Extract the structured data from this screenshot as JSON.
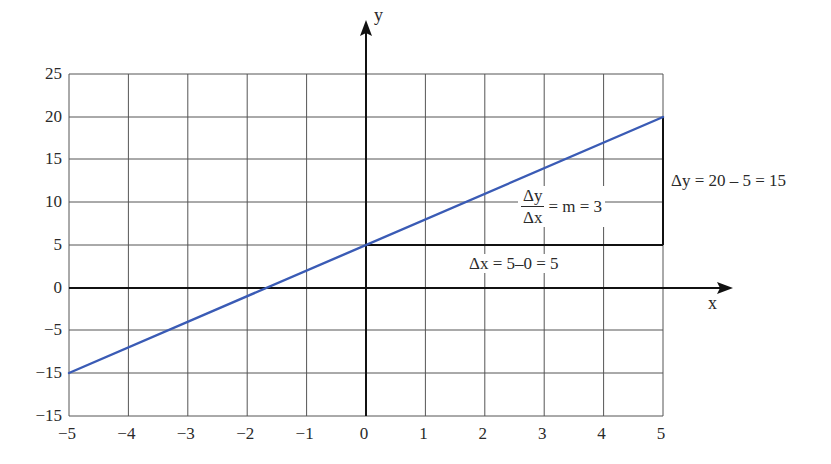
{
  "chart_data": {
    "type": "line",
    "title": "",
    "xlabel": "x",
    "ylabel": "y",
    "xlim": [
      -5,
      5
    ],
    "ylim": [
      -15,
      25
    ],
    "x_ticks": [
      "−5",
      "−4",
      "−3",
      "−2",
      "−1",
      "0",
      "1",
      "2",
      "3",
      "4",
      "5"
    ],
    "y_ticks": [
      "25",
      "20",
      "15",
      "10",
      "5",
      "0",
      "−5",
      "−15",
      "−15"
    ],
    "grid": true,
    "series": [
      {
        "name": "y = 3x + 5",
        "color": "#3a5bb5",
        "x": [
          -5,
          5
        ],
        "y": [
          -10,
          20
        ]
      }
    ],
    "annotations": {
      "slope": {
        "numerator": "Δy",
        "denominator": "Δx",
        "rest": "= m = 3"
      },
      "delta_y": "Δy = 20 – 5 = 15",
      "delta_x": "Δx = 5–0 = 5"
    },
    "slope_triangle": {
      "start": [
        0,
        5
      ],
      "corner": [
        5,
        5
      ],
      "end": [
        5,
        20
      ]
    }
  },
  "colors": {
    "line": "#3a5bb5",
    "grid": "#555555",
    "axis": "#111111"
  }
}
